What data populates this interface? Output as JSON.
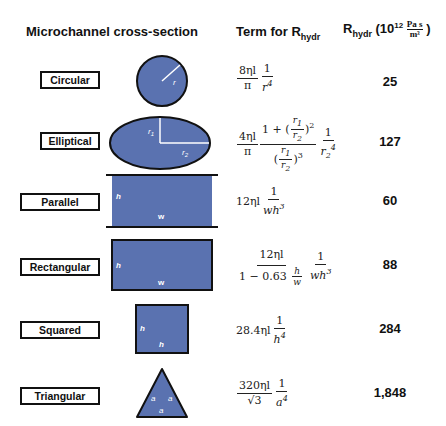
{
  "headers": {
    "cross_section": "Microchannel cross-section",
    "term_prefix": "Term for R",
    "term_sub": "hydr",
    "rhydr_prefix": "R",
    "rhydr_sub": "hydr",
    "rhydr_unit_open": "(10",
    "rhydr_unit_exp": "12",
    "rhydr_unit_num": "Pa s",
    "rhydr_unit_den": "m³",
    "rhydr_unit_close": ")"
  },
  "colors": {
    "shape_fill": "#5a72b0",
    "shape_stroke": "#111111",
    "annotation": "#ffffff"
  },
  "rows": [
    {
      "name": "Circular",
      "formula": "8ηl/π · 1/r⁴",
      "value": "25",
      "dims": [
        "r"
      ]
    },
    {
      "name": "Elliptical",
      "formula": "4ηl/π · (1 + (r1/r2)²)/((r1/r2)³) · 1/r2⁴",
      "value": "127",
      "dims": [
        "r1",
        "r2"
      ]
    },
    {
      "name": "Parallel",
      "formula": "12ηl · 1/(wh³)",
      "value": "60",
      "dims": [
        "h",
        "w"
      ]
    },
    {
      "name": "Rectangular",
      "formula": "12ηl/(1 − 0.63 h/w) · 1/(wh³)",
      "value": "88",
      "dims": [
        "h",
        "w"
      ]
    },
    {
      "name": "Squared",
      "formula": "28.4ηl · 1/h⁴",
      "value": "284",
      "dims": [
        "h",
        "h"
      ]
    },
    {
      "name": "Triangular",
      "formula": "320ηl/√3 · 1/a⁴",
      "value": "1,848",
      "dims": [
        "a",
        "a",
        "a"
      ]
    }
  ],
  "formula_parts": {
    "circ_n1": "8ηl",
    "circ_d1": "π",
    "circ_n2": "1",
    "circ_d2": "r",
    "circ_d2_exp": "4",
    "ell_n1": "4ηl",
    "ell_d1": "π",
    "ell_one_plus": "1 + ",
    "ell_r1": "r",
    "ell_r2": "r",
    "ell_one": "1",
    "par_coef": "12ηl",
    "par_n": "1",
    "rect_n1": "12ηl",
    "rect_d1": "1 − 0.63",
    "rect_n2": "1",
    "sq_coef": "28.4ηl",
    "sq_n": "1",
    "tri_n1": "320ηl",
    "tri_d1": "√3",
    "tri_n2": "1"
  }
}
